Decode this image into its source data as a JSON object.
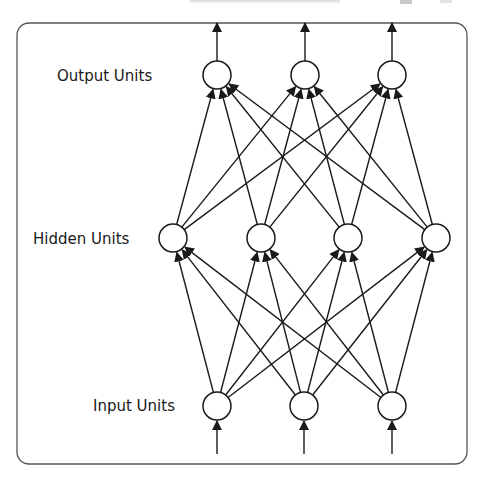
{
  "diagram": {
    "type": "feedforward-neural-network",
    "layers": [
      {
        "id": "output",
        "label": "Output Units",
        "units": 3
      },
      {
        "id": "hidden",
        "label": "Hidden Units",
        "units": 4
      },
      {
        "id": "input",
        "label": "Input Units",
        "units": 3
      }
    ],
    "connections": [
      {
        "from": "input",
        "to": "hidden",
        "pattern": "fully-connected"
      },
      {
        "from": "hidden",
        "to": "output",
        "pattern": "fully-connected"
      }
    ],
    "external_inputs": 3,
    "external_outputs": 3,
    "colors": {
      "stroke": "#1a1a1a",
      "node_fill": "#ffffff",
      "frame": "#555555"
    }
  }
}
